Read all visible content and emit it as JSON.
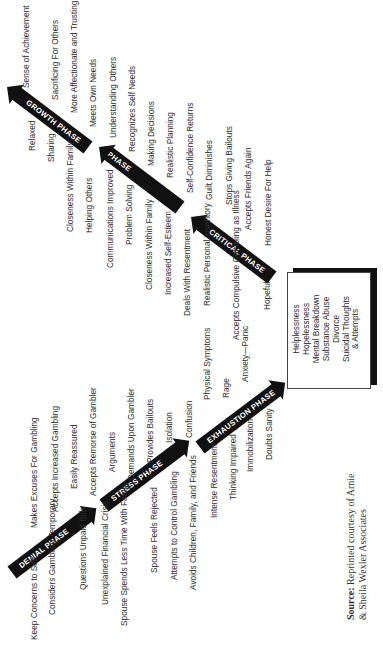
{
  "diagram": {
    "phases": [
      {
        "name": "DENIAL PHASE",
        "items": [
          "Keep Concerns to Self",
          "Considers Gambling Temporary",
          "Questions Unpaid Bills",
          "Makes Excuses For Gambling",
          "Accepts Increased Gambling",
          "Easily Reassured",
          "Accepts Remorse of Gambler"
        ]
      },
      {
        "name": "STRESS PHASE",
        "items": [
          "Unexplained Financial Crisis",
          "Spouse Spends Less Time With Family",
          "Spouse Feels Rejected",
          "Attempts to Control Gambling",
          "Avoids Children, Family, and Friends",
          "Arguments",
          "Demands Upon Gambler",
          "Provides Bailouts",
          "Isolation",
          "Confusion"
        ]
      },
      {
        "name": "EXHAUSTION PHASE",
        "items": [
          "Intense Resentment",
          "Thinking Impaired",
          "Immobilization",
          "Doubts Sanity",
          "Physical Symptoms",
          "Rage",
          "Anxiety—Panic"
        ]
      },
      {
        "name": "CRITICAL PHASE",
        "items": [
          "Deals With Resentment",
          "Realistic Personal Inventory",
          "Accepts Compulsive Gambling as Illness",
          "Hopeful",
          "Guilt Diminishes",
          "Stops Giving Bailouts",
          "Accepts Friends Again",
          "Honest Desire For Help"
        ]
      },
      {
        "name": "REBUILDING PHASE",
        "items": [
          "Communications Improved",
          "Problem Solving",
          "Closeness Within Family",
          "Increased Self-Esteem",
          "Understanding Others",
          "Recognizes Self Needs",
          "Making Decisions",
          "Realistic Planning",
          "Self-Confidence Returns"
        ]
      },
      {
        "name": "GROWTH PHASE",
        "items": [
          "Relaxed",
          "Sharing",
          "Closeness Within Family",
          "Helping Others",
          "Sense of Achievement",
          "Sacrificing For Others",
          "More Affectionate and Trusting",
          "Meets Own Needs"
        ]
      }
    ],
    "outcome_box": [
      "Helplessness",
      "Hopelessness",
      "Mental Breakdown",
      "Substance Abuse",
      "Divorce",
      "Suicidal Thoughts",
      "& Attempts"
    ],
    "source": {
      "label": "Source:",
      "text_line1": "Reprinted courtesy of Arnie",
      "text_line2": "& Sheila Wexler Associates"
    }
  }
}
